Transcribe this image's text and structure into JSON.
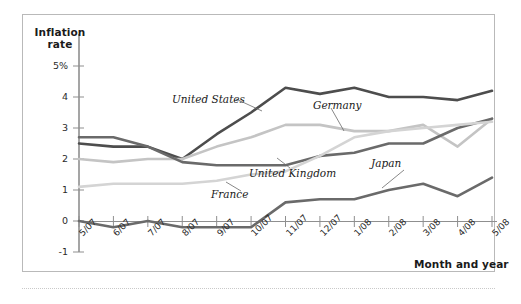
{
  "figure": {
    "background_color": "#ffffff",
    "frame_color": "#b9b9b9"
  },
  "axes": {
    "y_axis_title_line1": "Inflation",
    "y_axis_title_line2": "rate",
    "x_axis_title": "Month and year",
    "y_ticks": [
      "5%",
      "4",
      "3",
      "2",
      "1",
      "0",
      "-1"
    ],
    "x_ticks": [
      "5/07",
      "6/07",
      "7/07",
      "8/07",
      "9/07",
      "10/07",
      "11/07",
      "12/07",
      "1/08",
      "2/08",
      "3/08",
      "4/08",
      "5/08"
    ]
  },
  "series_labels": {
    "united_states": "United States",
    "germany": "Germany",
    "united_kingdom": "United Kingdom",
    "france": "France",
    "japan": "Japan"
  },
  "chart_data": {
    "type": "line",
    "title": "",
    "xlabel": "Month and year",
    "ylabel": "Inflation rate",
    "ylim": [
      -1,
      5.5
    ],
    "ytick_values": [
      5,
      4,
      3,
      2,
      1,
      0,
      -1
    ],
    "grid": false,
    "legend": "inline-labels",
    "categories": [
      "5/07",
      "6/07",
      "7/07",
      "8/07",
      "9/07",
      "10/07",
      "11/07",
      "12/07",
      "1/08",
      "2/08",
      "3/08",
      "4/08",
      "5/08"
    ],
    "series": [
      {
        "name": "United States",
        "color": "#4d4d4d",
        "values": [
          2.5,
          2.4,
          2.4,
          2.0,
          2.8,
          3.5,
          4.3,
          4.1,
          4.3,
          4.0,
          4.0,
          3.9,
          4.2
        ]
      },
      {
        "name": "Germany",
        "color": "#c4c4c4",
        "values": [
          2.0,
          1.9,
          2.0,
          2.0,
          2.4,
          2.7,
          3.1,
          3.1,
          2.9,
          2.9,
          3.1,
          2.4,
          3.3
        ]
      },
      {
        "name": "United Kingdom",
        "color": "#6a6a6a",
        "values": [
          2.7,
          2.7,
          2.4,
          1.9,
          1.8,
          1.8,
          1.8,
          2.1,
          2.2,
          2.5,
          2.5,
          3.0,
          3.3
        ]
      },
      {
        "name": "France",
        "color": "#d4d4d4",
        "values": [
          1.1,
          1.2,
          1.2,
          1.2,
          1.3,
          1.5,
          1.6,
          2.1,
          2.7,
          2.9,
          3.0,
          3.1,
          3.2
        ]
      },
      {
        "name": "Japan",
        "color": "#6a6a6a",
        "values": [
          0.0,
          -0.2,
          0.0,
          -0.2,
          -0.2,
          -0.2,
          0.6,
          0.7,
          0.7,
          1.0,
          1.2,
          0.8,
          1.4
        ]
      }
    ]
  }
}
